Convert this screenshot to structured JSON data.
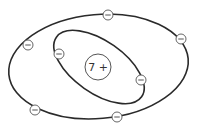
{
  "diagram": {
    "type": "bohr-atom-model",
    "nucleus": {
      "label": "7 +",
      "cx": 98,
      "cy": 67,
      "r": 13
    },
    "orbits": [
      {
        "name": "inner-shell",
        "cx": 99,
        "cy": 67,
        "rx": 52,
        "ry": 26,
        "rotate": 35
      },
      {
        "name": "outer-shell",
        "cx": 98.5,
        "cy": 66.5,
        "rx": 90,
        "ry": 52,
        "rotate": -5
      }
    ],
    "electrons": [
      {
        "shell": "inner",
        "symbol": "−",
        "cx": 59,
        "cy": 54
      },
      {
        "shell": "inner",
        "symbol": "−",
        "cx": 141,
        "cy": 80
      },
      {
        "shell": "outer",
        "symbol": "−",
        "cx": 108,
        "cy": 15
      },
      {
        "shell": "outer",
        "symbol": "−",
        "cx": 181,
        "cy": 39
      },
      {
        "shell": "outer",
        "symbol": "−",
        "cx": 28,
        "cy": 45
      },
      {
        "shell": "outer",
        "symbol": "−",
        "cx": 35,
        "cy": 110
      },
      {
        "shell": "outer",
        "symbol": "−",
        "cx": 117,
        "cy": 117
      }
    ],
    "electron_radius": 5,
    "colors": {
      "orbit": "#2a2a2a",
      "outline": "#555555",
      "fill": "#ffffff"
    }
  }
}
